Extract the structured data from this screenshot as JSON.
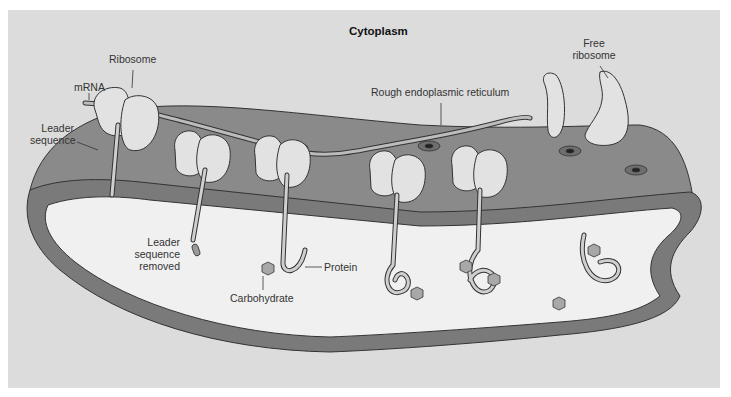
{
  "diagram": {
    "title": "Cytoplasm",
    "labels": {
      "ribosome": "Ribosome",
      "mrna": "mRNA",
      "leader_sequence_1": "Leader",
      "leader_sequence_2": "sequence",
      "rough_er": "Rough endoplasmic reticulum",
      "free_ribosome_1": "Free",
      "free_ribosome_2": "ribosome",
      "leader_removed_1": "Leader",
      "leader_removed_2": "sequence",
      "leader_removed_3": "removed",
      "protein": "Protein",
      "carbohydrate": "Carbohydrate"
    },
    "colors": {
      "background": "#dcdcdc",
      "er_membrane": "#8a8a8a",
      "er_membrane_dark": "#6e6e6e",
      "er_lumen": "#f0f0f0",
      "ribosome": "#e2e2e2",
      "protein_strand": "#cfcfcf",
      "carbohydrate": "#a8a8a8",
      "outline": "#333333"
    },
    "counts": {
      "bound_ribosomes": 6,
      "free_ribosomes": 1,
      "carbohydrate_groups": 7
    }
  }
}
